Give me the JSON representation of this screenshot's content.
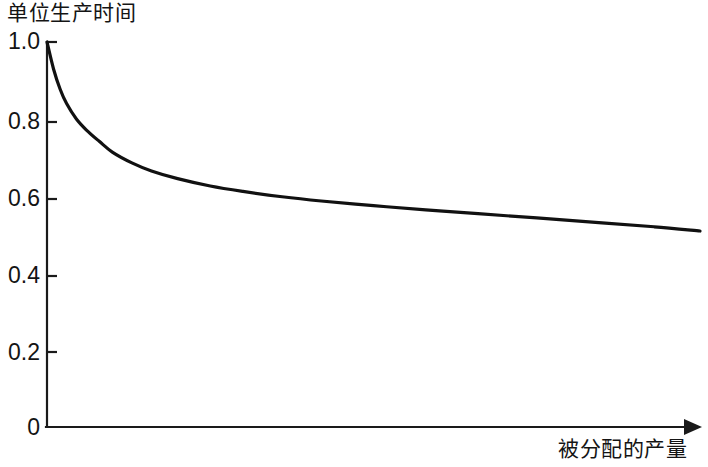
{
  "chart_data": {
    "type": "line",
    "title": "",
    "ylabel": "单位生产时间",
    "xlabel": "被分配的产量",
    "ylim": [
      0,
      1.0
    ],
    "xlim": [
      0,
      1.0
    ],
    "grid": false,
    "legend": "none",
    "y_ticks": [
      "1.0",
      "0.8",
      "0.6",
      "0.4",
      "0.2",
      "0"
    ],
    "y_tick_values": [
      1.0,
      0.8,
      0.6,
      0.4,
      0.2,
      0
    ],
    "x_ticks": [],
    "series": [
      {
        "name": "单位生产时间",
        "color": "#111111",
        "x": [
          0.0,
          0.01,
          0.02,
          0.03,
          0.045,
          0.06,
          0.08,
          0.1,
          0.13,
          0.16,
          0.2,
          0.25,
          0.3,
          0.36,
          0.42,
          0.5,
          0.58,
          0.66,
          0.75,
          0.85,
          0.93,
          1.0
        ],
        "values": [
          1.0,
          0.93,
          0.878,
          0.84,
          0.8,
          0.772,
          0.742,
          0.714,
          0.686,
          0.665,
          0.645,
          0.626,
          0.612,
          0.598,
          0.587,
          0.575,
          0.564,
          0.554,
          0.543,
          0.53,
          0.52,
          0.509
        ]
      }
    ]
  },
  "labels": {
    "y_axis_title": "单位生产时间",
    "x_axis_title": "被分配的产量",
    "y_tick_1": "1.0",
    "y_tick_2": "0.8",
    "y_tick_3": "0.6",
    "y_tick_4": "0.4",
    "y_tick_5": "0.2",
    "y_tick_6": "0"
  },
  "colors": {
    "curve": "#111111",
    "axis": "#1a1a1a",
    "background": "#ffffff",
    "text": "#141414"
  }
}
